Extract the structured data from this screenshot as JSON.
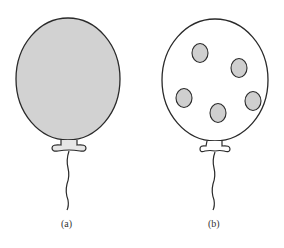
{
  "figure": {
    "panels": [
      {
        "id": "a",
        "caption": "(a)",
        "description": "solid gray-filled balloon",
        "fill": "#d2d2d2"
      },
      {
        "id": "b",
        "caption": "(b)",
        "description": "white balloon with five gray dots",
        "fill": "#ffffff",
        "dot_fill": "#cfcfcf",
        "dot_count": 5
      }
    ],
    "stroke_color": "#2a2a2a"
  }
}
